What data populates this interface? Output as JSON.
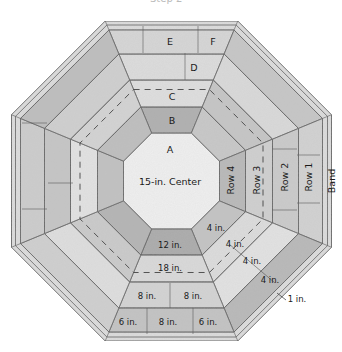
{
  "caption": "Step 2",
  "diagram": {
    "center": {
      "label": "15-in. Center",
      "letter": "A"
    },
    "top_rows": [
      {
        "id": "B",
        "label": "B"
      },
      {
        "id": "C",
        "label": "C"
      },
      {
        "id": "D",
        "label": "D"
      },
      {
        "id": "E",
        "label": "E"
      },
      {
        "id": "F",
        "label": "F"
      }
    ],
    "right_rows": [
      {
        "label": "Row 4"
      },
      {
        "label": "Row 3"
      },
      {
        "label": "Row 2"
      },
      {
        "label": "Row 1"
      },
      {
        "label": "Band"
      }
    ],
    "bottom_rows": [
      {
        "labels": [
          "12 in."
        ]
      },
      {
        "labels": [
          "18 in."
        ]
      },
      {
        "labels": [
          "8 in.",
          "8 in."
        ]
      },
      {
        "labels": [
          "6 in.",
          "8 in.",
          "6 in."
        ]
      }
    ],
    "diagonal_labels": [
      "4 in.",
      "4 in.",
      "4 in.",
      "4 in.",
      "1 in."
    ],
    "colors": {
      "background": "#ffffff",
      "light_stone": "#e4e4e4",
      "mid_stone": "#c8c8c8",
      "dark_stone": "#a9a9a9",
      "center_stone": "#efefef",
      "band": "#dcdcdc",
      "outline": "#5a5a5a",
      "text": "#1a1a1a"
    }
  }
}
